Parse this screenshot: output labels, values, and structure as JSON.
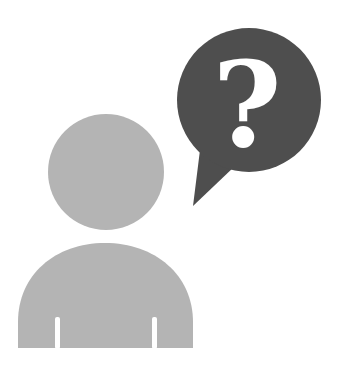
{
  "illustration": {
    "description": "person with question speech bubble",
    "person": {
      "icon": "person-icon",
      "color": "#b4b4b4"
    },
    "speech_bubble": {
      "icon": "speech-bubble-icon",
      "color": "#4e4e4e",
      "symbol": "?",
      "symbol_color": "#ffffff"
    }
  }
}
